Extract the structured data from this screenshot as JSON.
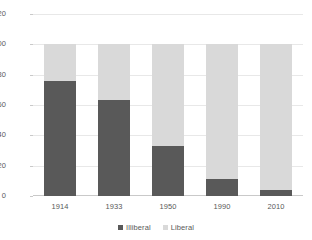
{
  "chart_data": {
    "type": "bar",
    "subtype": "stacked-bar",
    "title": "",
    "subtitle": "",
    "xlabel": "",
    "ylabel": "",
    "categories": [
      "1914",
      "1933",
      "1950",
      "1990",
      "2010"
    ],
    "series": [
      {
        "name": "Illiberal",
        "color": "#595959",
        "values": [
          76,
          63,
          33,
          11,
          4
        ]
      },
      {
        "name": "Liberal",
        "color": "#D9D9D9",
        "values": [
          24,
          37,
          67,
          89,
          96
        ]
      }
    ],
    "ylim": [
      0,
      120
    ],
    "yticks": [
      0,
      20,
      40,
      60,
      80,
      100,
      120
    ],
    "ytick_labels": [
      "0",
      "20",
      "40",
      "60",
      "80",
      "100",
      "120"
    ],
    "xtick_labels": [
      "1914",
      "1933",
      "1950",
      "1990",
      "2010"
    ],
    "grid": "horizontal",
    "grid_color": "#E8E8E8",
    "legend_position": "bottom-center",
    "legend_entries": [
      {
        "label": "Illiberal",
        "color": "#595959"
      },
      {
        "label": "Liberal",
        "color": "#D9D9D9"
      }
    ],
    "background_color": "#FFFFFF",
    "axis_color": "#C9C9C9",
    "text_color": "#595959"
  }
}
